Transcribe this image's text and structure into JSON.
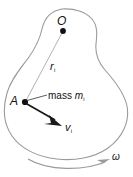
{
  "figure": {
    "type": "physics-diagram",
    "colors": {
      "body_outline": "#9a9a9a",
      "radius_line": "#b0b0b0",
      "leader_line": "#555555",
      "velocity_arrow": "#1a1a1a",
      "omega_arrow": "#9a9a9a",
      "point_marker": "#111111",
      "text": "#111111",
      "background": "#ffffff"
    },
    "labels": {
      "origin": "O",
      "radius": "r",
      "radius_subscript": "i",
      "point_a": "A",
      "mass_text": "mass ",
      "mass_symbol": "m",
      "mass_subscript": "i",
      "velocity": "v",
      "velocity_subscript": "i",
      "angular_velocity": "ω"
    },
    "points": {
      "origin": {
        "x": 63,
        "y": 31
      },
      "point_a": {
        "x": 25,
        "y": 102
      },
      "velocity_tip": {
        "x": 61,
        "y": 125
      }
    }
  }
}
